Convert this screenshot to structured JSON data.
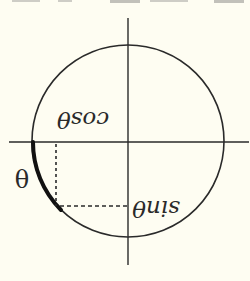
{
  "figure": {
    "rotation_deg": 180,
    "background_color": "#fefdf2",
    "ink_color": "#2a2a2a",
    "labels": {
      "theta": "θ",
      "cos": "cosθ",
      "sin": "sinθ"
    },
    "elements": {
      "circle": {
        "cx": 128,
        "cy": 141,
        "r": 96
      },
      "x_axis": {
        "x1": 9,
        "x2": 249,
        "y": 142
      },
      "y_axis": {
        "x": 128,
        "y1": 18,
        "y2": 265
      },
      "theta_arc": {
        "from": [
          33,
          142
        ],
        "to": [
          61,
          210
        ]
      },
      "cos_dashed_line": {
        "x": 56,
        "y1": 143,
        "y2": 206
      },
      "sin_dashed_line": {
        "y": 206,
        "x1": 58,
        "x2": 128
      }
    }
  }
}
